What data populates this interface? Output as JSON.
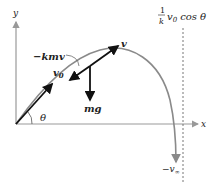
{
  "figure": {
    "type": "projectile-trajectory-with-linear-drag",
    "axes": {
      "x_label": "x",
      "y_label": "y"
    },
    "labels": {
      "drag_force": "−kmv",
      "velocity": "v",
      "initial_velocity": "v",
      "initial_velocity_sub": "0",
      "weight": "mg",
      "angle": "θ",
      "asymptote_frac_num": "1",
      "asymptote_frac_den": "k",
      "asymptote_v": "v",
      "asymptote_sub": "0",
      "asymptote_cos": "cos",
      "asymptote_theta": "θ",
      "terminal_velocity": "−v",
      "terminal_sub": "∞"
    },
    "colors": {
      "trajectory": "#8a8a8a",
      "axes": "#999999",
      "vectors": "#111111",
      "asymptote": "#666666"
    }
  }
}
